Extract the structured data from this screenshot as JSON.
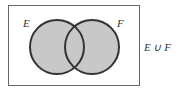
{
  "diagram": {
    "type": "venn",
    "sets": [
      {
        "label": "E",
        "shaded": true
      },
      {
        "label": "F",
        "shaded": true
      }
    ],
    "caption": "E ∪ F",
    "colors": {
      "fill": "#c8c8c8",
      "stroke": "#333333",
      "frame": "#555555"
    }
  }
}
